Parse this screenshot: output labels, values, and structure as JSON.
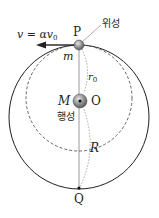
{
  "diagram": {
    "velocity_label": "v = αv",
    "velocity_sub": "0",
    "point_p": "P",
    "point_q": "Q",
    "satellite_label": "위성",
    "mass_satellite": "m",
    "radius_small": "r",
    "radius_small_sub": "0",
    "mass_planet": "M",
    "center_label": "O",
    "planet_label": "행성",
    "radius_large": "R",
    "colors": {
      "line": "#231f20",
      "dashed": "#555555",
      "sphere": "#8a8a8a"
    }
  }
}
